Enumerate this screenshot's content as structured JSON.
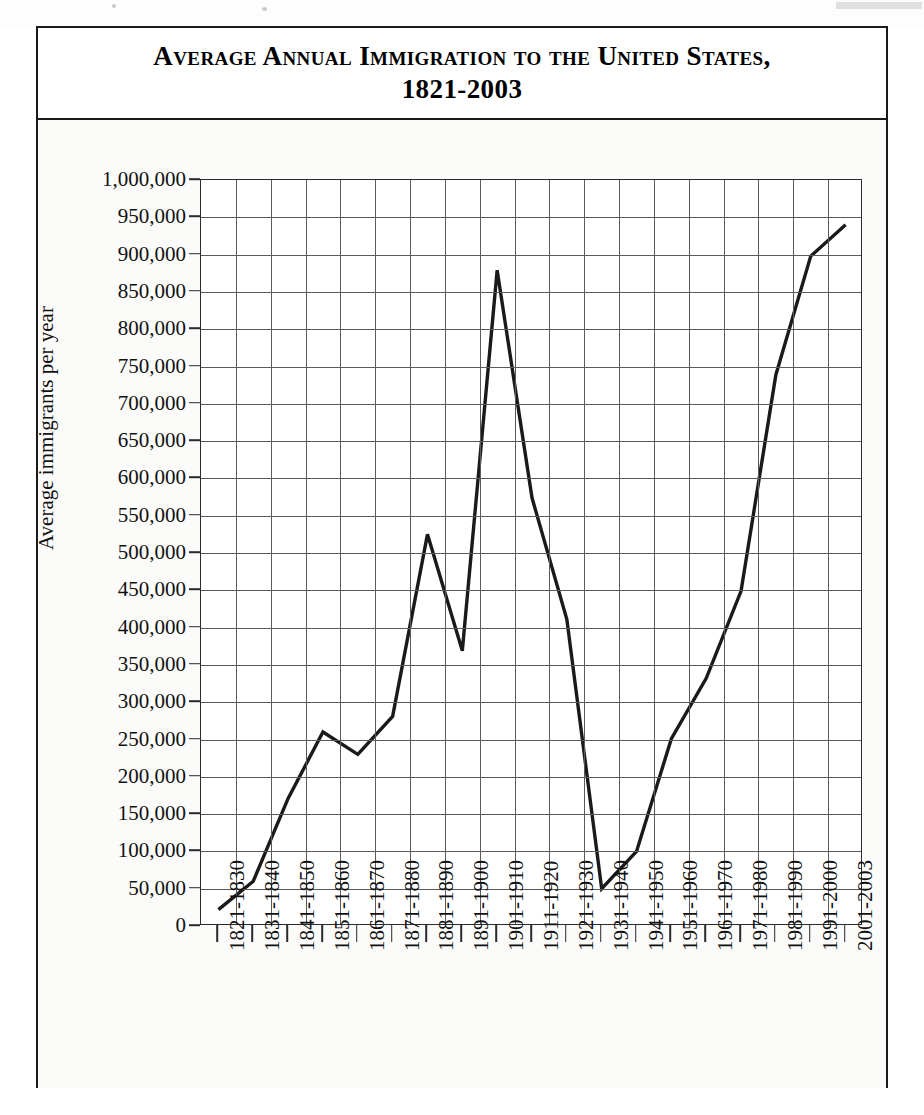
{
  "chart_title": "Average Annual Immigration to the United States, 1821-2003",
  "chart_title_line1": "Average Annual Immigration to the United States,",
  "chart_title_line2": "1821-2003",
  "chart_data": {
    "type": "line",
    "title": "Average Annual Immigration to the United States, 1821-2003",
    "xlabel": "",
    "ylabel": "Average immigrants per year",
    "ylim": [
      0,
      1000000
    ],
    "ytick_step": 50000,
    "grid": true,
    "legend": "none",
    "line_color": "#1a1a1a",
    "categories": [
      "1821-1830",
      "1831-1840",
      "1841-1850",
      "1851-1860",
      "1861-1870",
      "1871-1880",
      "1881-1890",
      "1891-1900",
      "1901-1910",
      "1911-1920",
      "1921-1930",
      "1931-1940",
      "1941-1950",
      "1951-1960",
      "1961-1970",
      "1971-1980",
      "1981-1990",
      "1991-2000",
      "2001-2003"
    ],
    "values": [
      22000,
      60000,
      171000,
      260000,
      230000,
      281000,
      525000,
      369000,
      879000,
      574000,
      411000,
      50000,
      100000,
      251000,
      332000,
      449000,
      739000,
      898000,
      940000
    ],
    "ytick_labels": [
      "0",
      "50,000",
      "100,000",
      "150,000",
      "200,000",
      "250,000",
      "300,000",
      "350,000",
      "400,000",
      "450,000",
      "500,000",
      "550,000",
      "600,000",
      "650,000",
      "700,000",
      "750,000",
      "800,000",
      "850,000",
      "900,000",
      "950,000",
      "1,000,000"
    ],
    "ytick_values": [
      0,
      50000,
      100000,
      150000,
      200000,
      250000,
      300000,
      350000,
      400000,
      450000,
      500000,
      550000,
      600000,
      650000,
      700000,
      750000,
      800000,
      850000,
      900000,
      950000,
      1000000
    ]
  }
}
